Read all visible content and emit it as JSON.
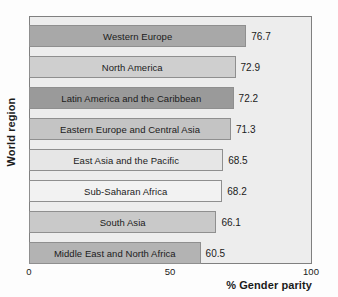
{
  "chart_data": {
    "type": "bar",
    "orientation": "horizontal",
    "title": "",
    "xlabel": "% Gender parity",
    "ylabel": "World region",
    "xlim": [
      0,
      100
    ],
    "xticks": [
      0,
      50,
      100
    ],
    "xticklabels": [
      "0",
      "50",
      "100"
    ],
    "grid": false,
    "legend": null,
    "categories": [
      "Western Europe",
      "North America",
      "Latin America and the Caribbean",
      "Eastern Europe and Central Asia",
      "East Asia and the Pacific",
      "Sub-Saharan Africa",
      "South Asia",
      "Middle East and North Africa"
    ],
    "values": [
      76.7,
      72.9,
      72.2,
      71.3,
      68.5,
      68.2,
      66.1,
      60.5
    ],
    "value_labels": [
      "76.7",
      "72.9",
      "72.2",
      "71.3",
      "68.5",
      "68.2",
      "66.1",
      "60.5"
    ],
    "bar_colors": [
      "#a8a8a8",
      "#cfcfcf",
      "#9a9a9a",
      "#c4c4c4",
      "#e6e6e6",
      "#f2f2f2",
      "#c9c9c9",
      "#b3b3b3"
    ],
    "bar_edge_color": "#8f8f8f",
    "plot_background": "#ededed",
    "figure_background": "#fdfdfd",
    "text_color": "#1b1b1b"
  }
}
